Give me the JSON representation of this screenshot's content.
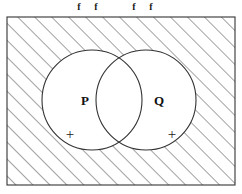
{
  "figure": {
    "type": "venn-diagram",
    "background_color": "#ffffff",
    "stroke_color": "#333333",
    "hatch_color": "#555555"
  },
  "top_labels": [
    {
      "text": "f",
      "x": 74,
      "y": 2
    },
    {
      "text": "f",
      "x": 91,
      "y": 2
    },
    {
      "text": "f",
      "x": 129,
      "y": 2
    },
    {
      "text": "f",
      "x": 146,
      "y": 2
    }
  ],
  "universe_rect": {
    "name": "universal-set",
    "x": 7,
    "y": 17,
    "width": 228,
    "height": 168,
    "fill": "hatched"
  },
  "circles": [
    {
      "id": "P",
      "label": "P",
      "cx": 92,
      "cy": 100,
      "r": 50,
      "label_x": 85,
      "label_y": 105,
      "plus": "+",
      "plus_x": 70,
      "plus_y": 139
    },
    {
      "id": "Q",
      "label": "Q",
      "cx": 146,
      "cy": 100,
      "r": 50,
      "label_x": 159,
      "label_y": 105,
      "plus": "+",
      "plus_x": 172,
      "plus_y": 139
    }
  ]
}
